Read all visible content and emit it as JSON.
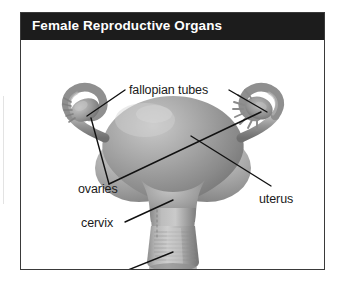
{
  "figure": {
    "title": "Female Reproductive Organs",
    "title_bar_color": "#1c1c1c",
    "title_text_color": "#ffffff",
    "frame_border_color": "#3a3a3a",
    "background_color": "#ffffff",
    "illustration_style": "grayscale anatomical rendering"
  },
  "labels": {
    "fallopian_tubes": "fallopian tubes",
    "ovaries": "ovaries",
    "uterus": "uterus",
    "cervix": "cervix",
    "vagina": "vagina"
  },
  "diagram_parts": [
    {
      "name": "fallopian tubes",
      "label": "fallopian tubes",
      "leader_lines": 2,
      "position": "upper left and upper right"
    },
    {
      "name": "ovaries",
      "label": "ovaries",
      "leader_lines": 2,
      "position": "left and right of uterus body"
    },
    {
      "name": "uterus",
      "label": "uterus",
      "leader_lines": 1,
      "position": "center body"
    },
    {
      "name": "cervix",
      "label": "cervix",
      "leader_lines": 1,
      "position": "below uterus body"
    },
    {
      "name": "vagina",
      "label": "vagina",
      "leader_lines": 1,
      "position": "bottom canal"
    }
  ]
}
